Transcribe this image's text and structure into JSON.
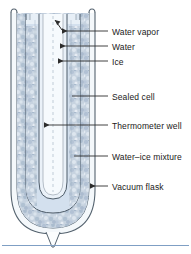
{
  "figure": {
    "type": "labeled-cross-section-diagram",
    "colors": {
      "outline": "#4a5a6a",
      "ice_fill": "#c3cfdd",
      "ice_speckle": "#8fa3ba",
      "water_fill": "#cfdcea",
      "vapor_fill": "#dbe6f1",
      "glass_fill": "#eef3f8",
      "label_text": "#1a1a1a",
      "leader_line": "#3a3a3a",
      "footer_rule": "#7f9fc4",
      "page_background": "#ffffff"
    },
    "labels": [
      {
        "id": "water-vapor",
        "text": "Water vapor",
        "x": 112,
        "y": 27,
        "leader_y": 31,
        "target_x": 62,
        "arrow": true
      },
      {
        "id": "water",
        "text": "Water",
        "x": 112,
        "y": 42,
        "leader_y": 46,
        "target_x": 60,
        "arrow": true
      },
      {
        "id": "ice",
        "text": "Ice",
        "x": 112,
        "y": 57,
        "leader_y": 61,
        "target_x": 58,
        "arrow": true
      },
      {
        "id": "sealed-cell",
        "text": "Sealed cell",
        "x": 112,
        "y": 92,
        "leader_y": 96,
        "target_x": 72,
        "arrow": false
      },
      {
        "id": "thermometer-well",
        "text": "Thermometer well",
        "x": 112,
        "y": 121,
        "leader_y": 125,
        "target_x": 44,
        "arrow": true
      },
      {
        "id": "water-ice-mixture",
        "text": "Water–ice mixture",
        "x": 112,
        "y": 152,
        "leader_y": 156,
        "target_x": 74,
        "arrow": false
      },
      {
        "id": "vacuum-flask",
        "text": "Vacuum flask",
        "x": 112,
        "y": 182,
        "leader_y": 186,
        "target_x": 90,
        "arrow": true
      }
    ],
    "parts": {
      "vacuum_flask": "outer double-walled dewar, open top, rounded bottom with pointed tip",
      "sealed_cell": "inner sealed glass cell containing water, ice and vapor",
      "thermometer_well": "central re-entrant tube open at top extending near cell bottom",
      "water_ice_mixture": "speckled ice-and-water packing filling the flask around the cell"
    }
  }
}
